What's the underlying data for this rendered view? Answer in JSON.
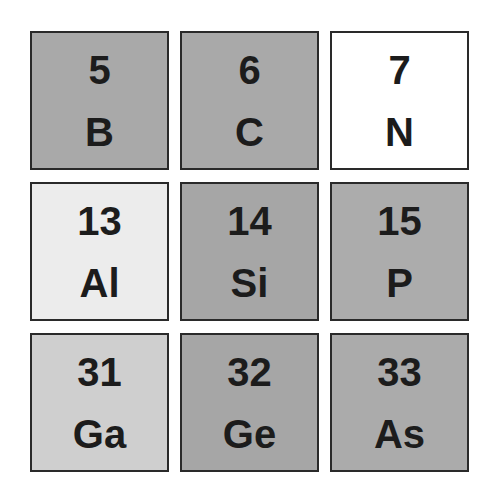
{
  "cells": [
    {
      "number": "5",
      "symbol": "B",
      "fill": "#a9a9a9"
    },
    {
      "number": "6",
      "symbol": "C",
      "fill": "#a9a9a9"
    },
    {
      "number": "7",
      "symbol": "N",
      "fill": "#ffffff"
    },
    {
      "number": "13",
      "symbol": "Al",
      "fill": "#ececec"
    },
    {
      "number": "14",
      "symbol": "Si",
      "fill": "#a6a6a6"
    },
    {
      "number": "15",
      "symbol": "P",
      "fill": "#acacac"
    },
    {
      "number": "31",
      "symbol": "Ga",
      "fill": "#cfcfcf"
    },
    {
      "number": "32",
      "symbol": "Ge",
      "fill": "#a6a6a6"
    },
    {
      "number": "33",
      "symbol": "As",
      "fill": "#ababab"
    }
  ]
}
